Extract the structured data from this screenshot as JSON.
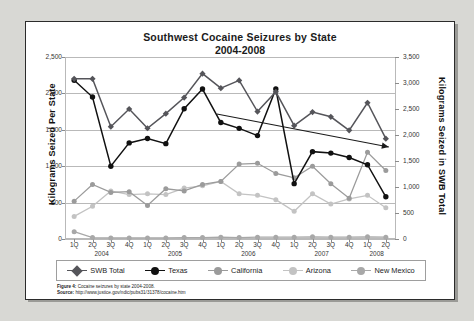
{
  "figure": {
    "title": "Southwest Cocaine Seizures by State",
    "subtitle": "2004-2008",
    "caption_label": "Figure 4:",
    "caption_text": " Cocaine seizures by state 2004-2008.",
    "source_label": "Source:",
    "source_text": " http://www.justice.gov/ndic/pubs31/31378/cocaine.htm"
  },
  "colors": {
    "swb_total": "#55555a",
    "texas": "#111111",
    "california": "#9b9b9b",
    "arizona": "#c3c3c3",
    "new_mexico": "#a8a8a8",
    "grid": "#b9b9b9",
    "trend_arrow": "#1b1b1b",
    "page_background": "#d8d8d4",
    "panel": "#ffffff"
  },
  "chart_data": {
    "type": "line",
    "title": "Southwest Cocaine Seizures by State 2004-2008",
    "xlabel": "Year",
    "ylabel": "Kilograms Seized Per State",
    "ylabel_right": "Kilograms Seized in SWB Total",
    "ylim": [
      0,
      2500
    ],
    "ylim_right": [
      0,
      3500
    ],
    "yticks": [
      "0",
      "500",
      "1,000",
      "1,500",
      "2,000",
      "2,500"
    ],
    "yticks_right": [
      "0",
      "500",
      "1,000",
      "1,500",
      "2,000",
      "2,500",
      "3,000",
      "3,500"
    ],
    "grid": true,
    "legend_position": "bottom",
    "x": [
      "1Q",
      "2Q",
      "3Q",
      "4Q",
      "1Q",
      "2Q",
      "3Q",
      "4Q",
      "1Q",
      "2Q",
      "3Q",
      "4Q",
      "1Q",
      "2Q",
      "3Q",
      "4Q",
      "1Q",
      "2Q"
    ],
    "year_groups": [
      {
        "label": "2004",
        "start_index": 0,
        "end_index": 3
      },
      {
        "label": "2005",
        "start_index": 4,
        "end_index": 7
      },
      {
        "label": "2006",
        "start_index": 8,
        "end_index": 11
      },
      {
        "label": "2007",
        "start_index": 12,
        "end_index": 15
      },
      {
        "label": "2008",
        "start_index": 16,
        "end_index": 17
      }
    ],
    "series": [
      {
        "name": "SWB Total",
        "axis": "right",
        "marker": "diamond",
        "color": "#55555a",
        "values": [
          3080,
          3080,
          2160,
          2500,
          2130,
          2410,
          2720,
          3180,
          2900,
          3050,
          2450,
          2830,
          2180,
          2440,
          2350,
          2090,
          2620,
          1930
        ]
      },
      {
        "name": "Texas",
        "axis": "left",
        "marker": "circle",
        "color": "#111111",
        "values": [
          2180,
          1950,
          1000,
          1320,
          1380,
          1310,
          1790,
          2060,
          1600,
          1520,
          1420,
          2060,
          760,
          1200,
          1180,
          1120,
          1020,
          580
        ]
      },
      {
        "name": "California",
        "axis": "left",
        "marker": "circle",
        "color": "#9b9b9b",
        "values": [
          520,
          750,
          640,
          650,
          460,
          690,
          660,
          750,
          790,
          1030,
          1040,
          900,
          840,
          1000,
          760,
          560,
          1190,
          940
        ]
      },
      {
        "name": "Arizona",
        "axis": "left",
        "marker": "circle",
        "color": "#c3c3c3",
        "values": [
          310,
          450,
          660,
          610,
          620,
          610,
          700,
          730,
          790,
          620,
          600,
          540,
          380,
          620,
          480,
          550,
          600,
          430
        ]
      },
      {
        "name": "New Mexico",
        "axis": "left",
        "marker": "circle",
        "color": "#a8a8a8",
        "values": [
          100,
          20,
          15,
          15,
          15,
          15,
          20,
          20,
          25,
          20,
          25,
          25,
          25,
          30,
          25,
          25,
          30,
          25
        ]
      }
    ],
    "annotations": [
      {
        "type": "trend-arrow",
        "label": "declining trend arrow",
        "from_index": 8,
        "to_index": 17,
        "direction": "down"
      }
    ]
  },
  "legend": {
    "items": [
      {
        "label": "SWB Total",
        "marker": "diamond",
        "color": "#55555a"
      },
      {
        "label": "Texas",
        "marker": "circle",
        "color": "#111111"
      },
      {
        "label": "California",
        "marker": "circle",
        "color": "#9b9b9b"
      },
      {
        "label": "Arizona",
        "marker": "circle",
        "color": "#c3c3c3"
      },
      {
        "label": "New Mexico",
        "marker": "circle",
        "color": "#a8a8a8"
      }
    ]
  }
}
